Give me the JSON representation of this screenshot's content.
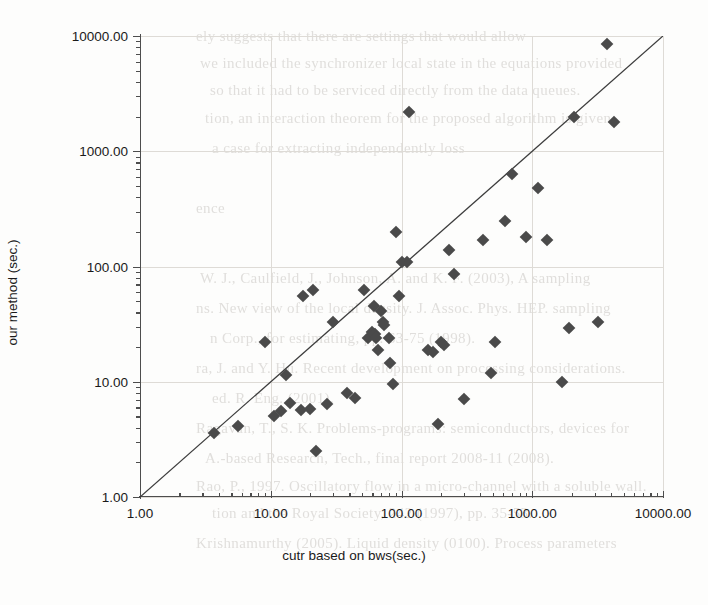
{
  "chart_data": {
    "type": "scatter",
    "title": "",
    "xlabel": "cutr based on bws(sec.)",
    "ylabel": "our method (sec.)",
    "xscale": "log",
    "yscale": "log",
    "xlim": [
      1,
      10000
    ],
    "ylim": [
      1,
      10000
    ],
    "grid": true,
    "legend": "none",
    "xtick_labels": [
      "1.00",
      "10.00",
      "100.00",
      "1000.00",
      "10000.00"
    ],
    "ytick_labels": [
      "1.00",
      "10.00",
      "100.00",
      "1000.00",
      "10000.00"
    ],
    "xticks": [
      1,
      10,
      100,
      1000,
      10000
    ],
    "yticks": [
      1,
      10,
      100,
      1000,
      10000
    ],
    "marker": "diamond",
    "marker_color": "#4a4a4a",
    "reference_line": {
      "label": "y = x",
      "from": [
        1,
        1
      ],
      "to": [
        10000,
        10000
      ],
      "color": "#3c3c3c"
    },
    "points": [
      [
        3.7,
        3.6
      ],
      [
        5.6,
        4.1
      ],
      [
        9.0,
        22.0
      ],
      [
        10.5,
        5.0
      ],
      [
        12.0,
        5.6
      ],
      [
        13.0,
        11.5
      ],
      [
        14.0,
        6.5
      ],
      [
        17.0,
        5.7
      ],
      [
        17.5,
        55.0
      ],
      [
        20.0,
        5.8
      ],
      [
        21.0,
        63.0
      ],
      [
        22.0,
        2.5
      ],
      [
        27.0,
        6.4
      ],
      [
        30.0,
        33.0
      ],
      [
        38.0,
        8.0
      ],
      [
        44.0,
        7.3
      ],
      [
        52.0,
        62.0
      ],
      [
        55.0,
        24.0
      ],
      [
        60.0,
        27.0
      ],
      [
        62.0,
        45.0
      ],
      [
        63.0,
        26.0
      ],
      [
        64.0,
        24.0
      ],
      [
        66.0,
        19.0
      ],
      [
        70.0,
        41.0
      ],
      [
        72.0,
        33.0
      ],
      [
        74.0,
        31.0
      ],
      [
        80.0,
        24.0
      ],
      [
        82.0,
        14.5
      ],
      [
        86.0,
        9.5
      ],
      [
        90.0,
        200.0
      ],
      [
        95.0,
        55.0
      ],
      [
        100.0,
        110.0
      ],
      [
        110.0,
        110.0
      ],
      [
        115.0,
        2200.0
      ],
      [
        160.0,
        19.0
      ],
      [
        175.0,
        18.0
      ],
      [
        190.0,
        4.3
      ],
      [
        200.0,
        22.0
      ],
      [
        210.0,
        21.0
      ],
      [
        230.0,
        140.0
      ],
      [
        250.0,
        86.0
      ],
      [
        300.0,
        7.1
      ],
      [
        420.0,
        170.0
      ],
      [
        480.0,
        12.0
      ],
      [
        520.0,
        22.0
      ],
      [
        620.0,
        250.0
      ],
      [
        700.0,
        630.0
      ],
      [
        900.0,
        180.0
      ],
      [
        1100.0,
        480.0
      ],
      [
        1300.0,
        170.0
      ],
      [
        1700.0,
        10.0
      ],
      [
        1900.0,
        29.0
      ],
      [
        2100.0,
        2000.0
      ],
      [
        3200.0,
        33.0
      ],
      [
        3700.0,
        8500.0
      ],
      [
        4200.0,
        1800.0
      ]
    ]
  },
  "background_text": {
    "lines": [
      "ely suggests that there are settings that would allow",
      "we included the synchronizer local state    in the equations provided",
      "so that it had to be serviced directly    from    the data queues.",
      "tion, an interaction theorem for the   proposed    algorithm is given",
      "a case for extracting independently loss",
      "",
      "ence",
      "",
      "W. J., Caulfield, J., Johnson, A. and K.   F.  (2003), A sampling",
      "ns. New view of the local density.    J. Assoc. Phys. HEP. sampling",
      "n Corp., for estimating, pp. 63-75 (1998).",
      "ra, J. and Y. Hu. Recent development on processing considerations.",
      "ed. R. Eng. (2001).",
      "Ragavan, T., S. K. Problems-programs: semiconductors, devices for",
      "A.-based Research, Tech., final report 2008-11 (2008).",
      "Rao, P., 1997. Oscillatory flow in a micro-channel with a soluble wall.",
      "tion and the Royal Society, 242 (1997),  pp. 35-53.",
      "Krishnamurthy (2005). Liquid  density  (0100).   Process      parameters"
    ]
  }
}
